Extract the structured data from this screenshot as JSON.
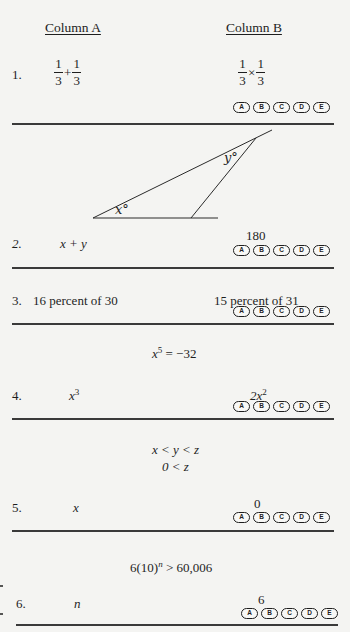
{
  "header": {
    "column_a": "Column A",
    "column_b": "Column B"
  },
  "answer_choices": [
    "A",
    "B",
    "C",
    "D",
    "E"
  ],
  "questions": [
    {
      "number": "1.",
      "column_a": {
        "num1": "1",
        "den1": "3",
        "op": "+",
        "num2": "1",
        "den2": "3"
      },
      "column_b": {
        "num1": "1",
        "den1": "3",
        "op": "×",
        "num2": "1",
        "den2": "3"
      }
    },
    {
      "number": "2.",
      "figure": {
        "angle_x_label": "x°",
        "angle_y_label": "y°"
      },
      "column_a": {
        "text": "x + y"
      },
      "column_b": {
        "text": "180"
      }
    },
    {
      "number": "3.",
      "column_a": {
        "text": "16 percent of 30"
      },
      "column_b": {
        "text": "15 percent of 31"
      }
    },
    {
      "number": "4.",
      "given": {
        "base": "x",
        "exp": "5",
        "rest": " = −32"
      },
      "column_a": {
        "base": "x",
        "exp": "3"
      },
      "column_b": {
        "base": "2x",
        "exp": "2"
      }
    },
    {
      "number": "5.",
      "given": {
        "line1": "x < y < z",
        "line2": "0 < z"
      },
      "column_a": {
        "text": "x"
      },
      "column_b": {
        "text": "0"
      }
    },
    {
      "number": "6.",
      "given": {
        "base": "6(10)",
        "exp": "n",
        "rest": " > 60,006"
      },
      "column_a": {
        "text": "n"
      },
      "column_b": {
        "text": "6"
      }
    }
  ]
}
